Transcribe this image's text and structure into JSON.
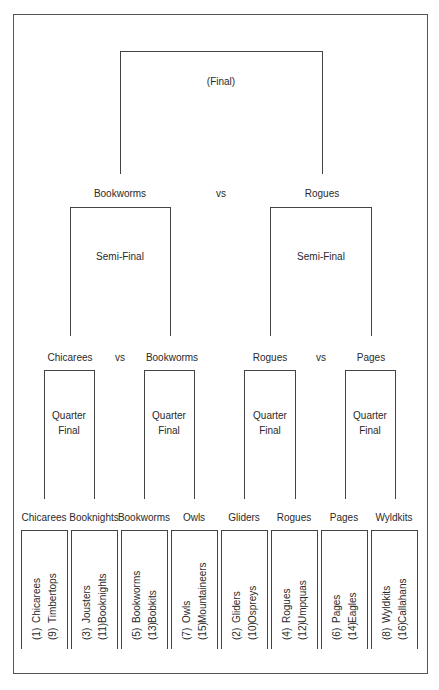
{
  "final": {
    "label": "(Final)",
    "left": "Bookworms",
    "vs": "vs",
    "right": "Rogues"
  },
  "semis": [
    {
      "label": "Semi-Final",
      "left": "Chicarees",
      "vs": "vs",
      "right": "Bookworms"
    },
    {
      "label": "Semi-Final",
      "left": "Rogues",
      "vs": "vs",
      "right": "Pages"
    }
  ],
  "quarters": [
    {
      "label_line1": "Quarter",
      "label_line2": "Final",
      "left": "Chicarees",
      "right": "Booknights"
    },
    {
      "label_line1": "Quarter",
      "label_line2": "Final",
      "left": "Bookworms",
      "right": "Owls"
    },
    {
      "label_line1": "Quarter",
      "label_line2": "Final",
      "left": "Gliders",
      "right": "Rogues"
    },
    {
      "label_line1": "Quarter",
      "label_line2": "Final",
      "left": "Pages",
      "right": "Wyldkits"
    }
  ],
  "round1": [
    {
      "winner": "Chicarees",
      "a_seed": "(1)",
      "a_team": "Chicarees",
      "b_seed": "(9)",
      "b_team": "Timbertops"
    },
    {
      "winner": "Booknights",
      "a_seed": "(3)",
      "a_team": "Jousters",
      "b_seed": "(11)",
      "b_team": "Booknights"
    },
    {
      "winner": "Bookworms",
      "a_seed": "(5)",
      "a_team": "Bookworms",
      "b_seed": "(13)",
      "b_team": "Bobkits"
    },
    {
      "winner": "Owls",
      "a_seed": "(7)",
      "a_team": "Owls",
      "b_seed": "(15)",
      "b_team": "Mountaineers"
    },
    {
      "winner": "Gliders",
      "a_seed": "(2)",
      "a_team": "Gliders",
      "b_seed": "(10)",
      "b_team": "Ospreys"
    },
    {
      "winner": "Rogues",
      "a_seed": "(4)",
      "a_team": "Rogues",
      "b_seed": "(12)",
      "b_team": "Umpquas"
    },
    {
      "winner": "Pages",
      "a_seed": "(6)",
      "a_team": "Pages",
      "b_seed": "(14)",
      "b_team": "Eagles"
    },
    {
      "winner": "Wyldkits",
      "a_seed": "(8)",
      "a_team": "Wyldkits",
      "b_seed": "(16)",
      "b_team": "Callahans"
    }
  ]
}
